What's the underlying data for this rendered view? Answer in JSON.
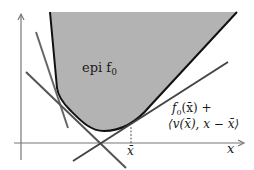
{
  "diagram": {
    "labels": {
      "epigraph": "epi f",
      "epigraph_sub": "0",
      "tangent_line1": "f",
      "tangent_line1_sub": "0",
      "tangent_line1_rest": "(x̄) +",
      "tangent_line2": "⟨v(x̄), x − x̄⟩",
      "point": "x̄",
      "axis_x": "x"
    },
    "colors": {
      "fill": "#b3b3b3",
      "boundary": "#111111",
      "lines": "#555555",
      "axes": "#777777",
      "text": "#1a1a1a"
    }
  }
}
